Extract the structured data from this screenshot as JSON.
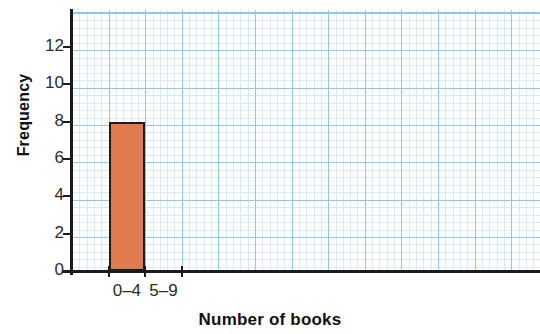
{
  "chart_data": {
    "type": "bar",
    "title": "",
    "subtitle": "",
    "xlabel": "Number of books",
    "ylabel": "Frequency",
    "categories": [
      "0–4",
      "5–9"
    ],
    "values": [
      8,
      0
    ],
    "series": [
      {
        "name": "Frequency",
        "values": [
          8,
          0
        ]
      }
    ],
    "ylim": [
      0,
      13.5
    ],
    "y_ticks": [
      "0",
      "2",
      "4",
      "6",
      "8",
      "10",
      "12"
    ],
    "y_tick_values": [
      0,
      2,
      4,
      6,
      8,
      10,
      12
    ],
    "x_tick_labels": [
      "0–4",
      "5–9"
    ],
    "grid": true,
    "grid_style": "graph-paper",
    "legend": "none",
    "bar_color": "#e07b50",
    "bar_edge_color": "#1b1b1b",
    "grid_major_color": "#8ec8ea",
    "grid_minor_color": "#d7ebf7",
    "axis_color": "#1b1b1b"
  },
  "axes": {
    "y_title": "Frequency",
    "x_title": "Number of books"
  },
  "ticks": {
    "y": [
      {
        "label": "12",
        "value": 12
      },
      {
        "label": "10",
        "value": 10
      },
      {
        "label": "8",
        "value": 8
      },
      {
        "label": "6",
        "value": 6
      },
      {
        "label": "4",
        "value": 4
      },
      {
        "label": "2",
        "value": 2
      },
      {
        "label": "0",
        "value": 0
      }
    ],
    "x": [
      {
        "label": "0–4"
      },
      {
        "label": "5–9"
      }
    ]
  }
}
